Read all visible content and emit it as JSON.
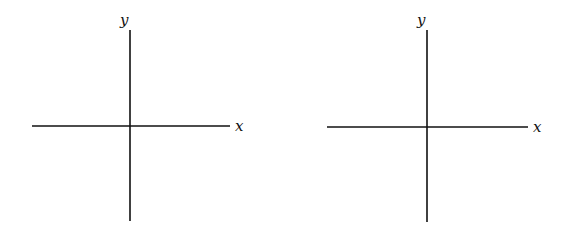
{
  "diagrams": [
    {
      "name": "left-axes",
      "x_label": "x",
      "y_label": "y",
      "x_axis": {
        "x1": 32,
        "x2": 230,
        "y": 126
      },
      "y_axis": {
        "x": 130,
        "y1": 30,
        "y2": 221
      },
      "x_label_pos": [
        235,
        131
      ],
      "y_label_pos": [
        120,
        25
      ]
    },
    {
      "name": "right-axes",
      "x_label": "x",
      "y_label": "y",
      "x_axis": {
        "x1": 327,
        "x2": 528,
        "y": 127
      },
      "y_axis": {
        "x": 427,
        "y1": 30,
        "y2": 222
      },
      "x_label_pos": [
        533,
        132
      ],
      "y_label_pos": [
        417,
        25
      ]
    }
  ]
}
